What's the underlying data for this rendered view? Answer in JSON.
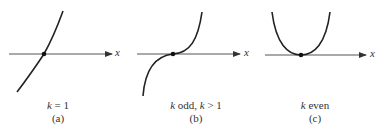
{
  "panels": [
    {
      "id": "a",
      "condition_var": "k",
      "condition_rest": " = 1",
      "tag": "(a)",
      "axis_label": "x",
      "curve": "linear (k = 1)"
    },
    {
      "id": "b",
      "condition_var": "k",
      "condition_rest": " odd, ",
      "condition_var2": "k",
      "condition_rest2": " > 1",
      "tag": "(b)",
      "axis_label": "x",
      "curve": "odd power, flat inflection at origin"
    },
    {
      "id": "c",
      "condition_var": "k",
      "condition_rest": " even",
      "tag": "(c)",
      "axis_label": "x",
      "curve": "even power, parabola-like touching axis"
    }
  ],
  "colors": {
    "curve": "#222222",
    "axis": "#444444",
    "point": "#111111"
  }
}
